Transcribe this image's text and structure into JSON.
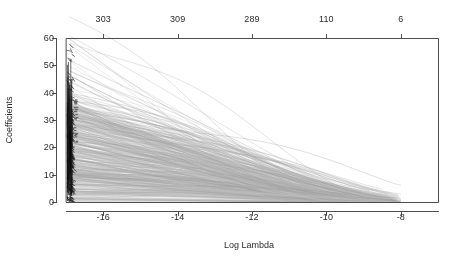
{
  "chart_data": {
    "type": "line",
    "title": "",
    "xlabel": "Log Lambda",
    "ylabel": "Coefficients",
    "xlim": [
      -17.0,
      -7.0
    ],
    "ylim": [
      0,
      60
    ],
    "grid": false,
    "legend": null,
    "xticks": [
      -16,
      -14,
      -12,
      -10,
      -8
    ],
    "xticklabels": [
      "-16",
      "-14",
      "-12",
      "-10",
      "-8"
    ],
    "yticks": [
      0,
      10,
      20,
      30,
      40,
      50,
      60
    ],
    "yticklabels": [
      "0",
      "10",
      "20",
      "30",
      "40",
      "50",
      "60"
    ],
    "top_axis": {
      "label": "",
      "ticks": [
        -16,
        -14,
        -12,
        -10,
        -8
      ],
      "ticklabels": [
        "303",
        "309",
        "289",
        "110",
        "6"
      ],
      "meaning": "number of nonzero coefficients"
    },
    "line_color": "#a8a8a8",
    "axis_color": "#4d4d4d",
    "n_series": 420,
    "series_summary": [
      {
        "name": "band-start-log-lambda",
        "value": -16.9
      },
      {
        "name": "max-coefficient",
        "value": 60
      },
      {
        "name": "typical-peak-range",
        "value": [
          18,
          34
        ]
      },
      {
        "name": "shrink-to-zero-log-lambda",
        "value": -8.0
      }
    ]
  },
  "axes": {
    "y_label": "Coefficients",
    "x_label": "Log Lambda"
  }
}
